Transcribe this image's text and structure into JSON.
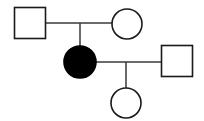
{
  "diagram": {
    "type": "pedigree",
    "background_color": "#ffffff",
    "line_color": "#3a3a3a",
    "symbol_stroke_color": "#1a1a1a",
    "affected_fill_color": "#000000",
    "unaffected_fill_color": "#ffffff",
    "width": 204,
    "height": 121,
    "generations": [
      {
        "id": "generation-1",
        "label": "I",
        "individuals": [
          {
            "id": "i-1",
            "shape": "square",
            "sex": "male",
            "status": "unaffected",
            "fill": "#ffffff",
            "x": 30,
            "y": 23,
            "size": 31
          },
          {
            "id": "i-2",
            "shape": "circle",
            "sex": "female",
            "status": "unaffected",
            "fill": "#ffffff",
            "x": 127,
            "y": 24,
            "radius": 15
          }
        ]
      },
      {
        "id": "generation-2",
        "label": "II",
        "individuals": [
          {
            "id": "ii-1",
            "shape": "circle",
            "sex": "female",
            "status": "affected",
            "fill": "#000000",
            "x": 80,
            "y": 62,
            "radius": 16
          },
          {
            "id": "ii-2",
            "shape": "square",
            "sex": "male",
            "status": "unaffected",
            "fill": "#ffffff",
            "x": 177,
            "y": 61,
            "size": 31
          }
        ]
      },
      {
        "id": "generation-3",
        "label": "III",
        "individuals": [
          {
            "id": "iii-1",
            "shape": "circle",
            "sex": "female",
            "status": "unaffected",
            "fill": "#ffffff",
            "x": 126,
            "y": 103,
            "radius": 15
          }
        ]
      }
    ],
    "connectors": [
      {
        "id": "mating-line-1",
        "kind": "mating-line",
        "from": "i-1",
        "to": "i-2",
        "x1": 45,
        "y1": 23,
        "x2": 112,
        "y2": 23
      },
      {
        "id": "descent-line-1",
        "kind": "descent-line",
        "from": "mating-line-1",
        "to": "ii-1",
        "x1": 80,
        "y1": 23,
        "x2": 80,
        "y2": 47
      },
      {
        "id": "mating-line-2",
        "kind": "mating-line",
        "from": "ii-1",
        "to": "ii-2",
        "x1": 96,
        "y1": 62,
        "x2": 162,
        "y2": 62
      },
      {
        "id": "descent-line-2",
        "kind": "descent-line",
        "from": "mating-line-2",
        "to": "iii-1",
        "x1": 126,
        "y1": 62,
        "x2": 126,
        "y2": 88
      }
    ]
  }
}
